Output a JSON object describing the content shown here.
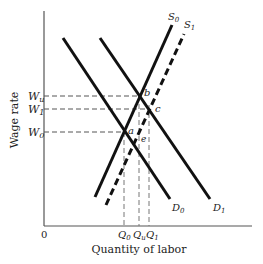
{
  "diagram": {
    "type": "labor-market-supply-demand",
    "axes": {
      "y_label": "Wage rate",
      "x_label": "Quantity of labor",
      "origin_label": "0"
    },
    "wage_levels": [
      {
        "id": "Wu",
        "base": "W",
        "sub": "u"
      },
      {
        "id": "W1",
        "base": "W",
        "sub": "1"
      },
      {
        "id": "W0",
        "base": "W",
        "sub": "0"
      }
    ],
    "quantity_levels": [
      {
        "id": "Q0",
        "base": "Q",
        "sub": "0"
      },
      {
        "id": "Qu",
        "base": "Q",
        "sub": "u"
      },
      {
        "id": "Q1",
        "base": "Q",
        "sub": "1"
      }
    ],
    "curves": [
      {
        "id": "D0",
        "base": "D",
        "sub": "0",
        "style": "solid"
      },
      {
        "id": "D1",
        "base": "D",
        "sub": "1",
        "style": "solid"
      },
      {
        "id": "S0",
        "base": "S",
        "sub": "0",
        "style": "solid"
      },
      {
        "id": "S1",
        "base": "S",
        "sub": "1",
        "style": "dashed"
      }
    ],
    "points": [
      {
        "id": "a",
        "label": "a"
      },
      {
        "id": "b",
        "label": "b"
      },
      {
        "id": "c",
        "label": "c"
      },
      {
        "id": "e",
        "label": "e"
      }
    ]
  }
}
